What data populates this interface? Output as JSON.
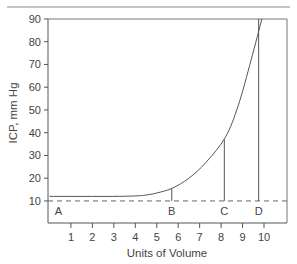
{
  "chart_data": {
    "type": "line",
    "title": "",
    "xlabel": "Units of Volume",
    "ylabel": "ICP, mm Hg",
    "xlim": [
      0,
      11
    ],
    "ylim": [
      0,
      90
    ],
    "x_ticks": [
      1,
      2,
      3,
      4,
      5,
      6,
      7,
      8,
      9,
      10
    ],
    "y_ticks": [
      10,
      20,
      30,
      40,
      50,
      60,
      70,
      80,
      90
    ],
    "grid": false,
    "series": [
      {
        "name": "Volume-pressure curve",
        "x": [
          0,
          1,
          2,
          3,
          4,
          4.5,
          5,
          5.7,
          6.5,
          7.3,
          8.2,
          8.8,
          9.4,
          9.9
        ],
        "values": [
          12,
          12,
          12,
          12,
          12.2,
          12.6,
          13.5,
          15.5,
          20,
          27,
          38,
          52,
          72,
          90
        ]
      }
    ],
    "reference_line": {
      "y": 10,
      "style": "dashed"
    },
    "annotations": [
      {
        "label": "A",
        "x": 0.2,
        "marker_top": null
      },
      {
        "label": "B",
        "x": 5.7,
        "marker_top": 15.5
      },
      {
        "label": "C",
        "x": 8.15,
        "marker_top": 37
      },
      {
        "label": "D",
        "x": 9.75,
        "marker_top": 90
      }
    ]
  },
  "labels": {
    "xlabel": "Units of Volume",
    "ylabel": "ICP, mm Hg",
    "A": "A",
    "B": "B",
    "C": "C",
    "D": "D"
  },
  "colors": {
    "line": "#555555",
    "axis": "#555555",
    "dashed": "#666666"
  }
}
